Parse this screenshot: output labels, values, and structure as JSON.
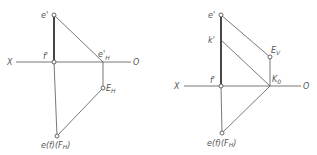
{
  "figures": [
    {
      "id": "left",
      "axis": {
        "left_label": "X",
        "right_label": "O"
      },
      "labels": {
        "e_prime": "e'",
        "f_prime": "f'",
        "eH_prime_main": "e'",
        "eH_prime_sub": "H",
        "EH_main": "E",
        "EH_sub": "H",
        "bottom_main": "e(f)(F",
        "bottom_sub": "H",
        "bottom_close": ")"
      }
    },
    {
      "id": "right",
      "axis": {
        "left_label": "X",
        "right_label": "O"
      },
      "labels": {
        "e_prime": "e'",
        "k_prime": "k'",
        "f_prime": "f'",
        "Ev_main": "E",
        "Ev_sub": "V",
        "K0_main": "K",
        "K0_sub": "0",
        "bottom_main": "e(f)(F",
        "bottom_sub": "H",
        "bottom_close": ")"
      }
    }
  ],
  "colors": {
    "line": "#555555",
    "thick_line": "#333333",
    "text": "#555555",
    "background": "#ffffff"
  }
}
